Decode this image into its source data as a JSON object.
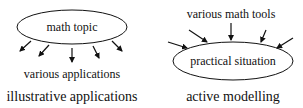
{
  "left_diagram": {
    "node_label": "math topic",
    "target_label": "various applications",
    "caption": "illustrative applications",
    "arrow_count": 5
  },
  "right_diagram": {
    "source_label": "various math tools",
    "node_label": "practical situation",
    "caption": "active modelling",
    "arrow_count": 5
  },
  "colors": {
    "stroke": "#111111",
    "background": "#ffffff"
  }
}
